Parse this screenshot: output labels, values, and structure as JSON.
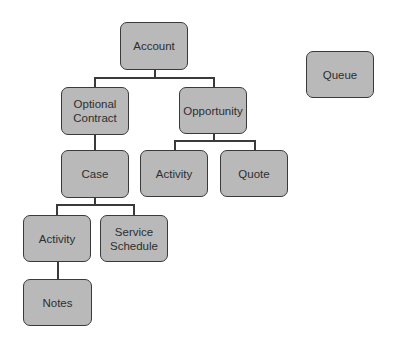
{
  "diagram": {
    "type": "hierarchy",
    "colors": {
      "node_fill": "#b9b9b9",
      "node_border": "#3a3a3a",
      "connector": "#3a3a3a",
      "text": "#2e2e2e"
    },
    "nodes": [
      {
        "id": "account",
        "label": "Account",
        "x": 120,
        "y": 22,
        "w": 68,
        "h": 48
      },
      {
        "id": "optional-contract",
        "label": "Optional\nContract",
        "x": 61,
        "y": 87,
        "w": 68,
        "h": 48
      },
      {
        "id": "opportunity",
        "label": "Opportunity",
        "x": 179,
        "y": 87,
        "w": 68,
        "h": 47
      },
      {
        "id": "queue",
        "label": "Queue",
        "x": 306,
        "y": 51,
        "w": 68,
        "h": 47
      },
      {
        "id": "case",
        "label": "Case",
        "x": 61,
        "y": 150,
        "w": 68,
        "h": 48
      },
      {
        "id": "opportunity-activity",
        "label": "Activity",
        "x": 140,
        "y": 150,
        "w": 68,
        "h": 47
      },
      {
        "id": "quote",
        "label": "Quote",
        "x": 220,
        "y": 150,
        "w": 68,
        "h": 47
      },
      {
        "id": "case-activity",
        "label": "Activity",
        "x": 23,
        "y": 215,
        "w": 68,
        "h": 47
      },
      {
        "id": "service-schedule",
        "label": "Service\nSchedule",
        "x": 100,
        "y": 215,
        "w": 68,
        "h": 47
      },
      {
        "id": "notes",
        "label": "Notes",
        "x": 23,
        "y": 279,
        "w": 69,
        "h": 47
      }
    ],
    "edges": [
      {
        "from": "account",
        "to": "optional-contract"
      },
      {
        "from": "account",
        "to": "opportunity"
      },
      {
        "from": "optional-contract",
        "to": "case"
      },
      {
        "from": "opportunity",
        "to": "opportunity-activity"
      },
      {
        "from": "opportunity",
        "to": "quote"
      },
      {
        "from": "case",
        "to": "case-activity"
      },
      {
        "from": "case",
        "to": "service-schedule"
      },
      {
        "from": "case-activity",
        "to": "notes"
      }
    ]
  }
}
